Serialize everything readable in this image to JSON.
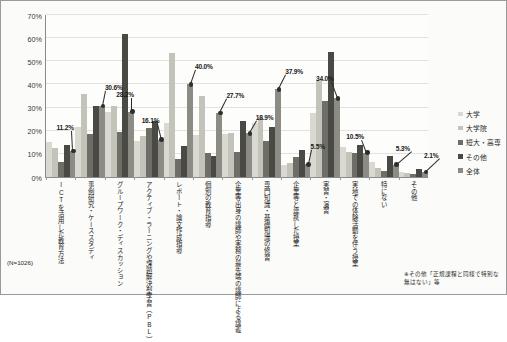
{
  "chart_data": {
    "type": "bar",
    "title": "",
    "xlabel": "",
    "ylabel": "",
    "ylim": [
      0,
      70
    ],
    "ytick_labels": [
      "0%",
      "10%",
      "20%",
      "30%",
      "40%",
      "50%",
      "60%",
      "70%"
    ],
    "ytick_values": [
      0,
      10,
      20,
      30,
      40,
      50,
      60,
      70
    ],
    "grid": true,
    "legend_position": "right",
    "categories": [
      "ICTを活用した教育方法",
      "事例研究・ケーススタディ",
      "グループワーク・ディスカッション",
      "アクティブ・ラーニングや課題解決型学習（PBL）",
      "レポート・論文作成指導",
      "個別の教育指導",
      "企業等出身の講師や実務の最先端の講師による講義",
      "専門知識・基礎知識の修習",
      "企業等と連携した授業",
      "実習・演習",
      "実地での体験活動を伴う授業",
      "特にない",
      "その他"
    ],
    "series": [
      {
        "name": "大学",
        "color": "#d9d9d2",
        "values": [
          15.0,
          21.5,
          28.0,
          15.4,
          23.2,
          18.0,
          18.8,
          23.5,
          5.0,
          27.5,
          13.0,
          6.5,
          2.0
        ]
      },
      {
        "name": "大学院",
        "color": "#c3c3ba",
        "values": [
          12.5,
          36.0,
          30.5,
          17.6,
          53.5,
          35.0,
          19.0,
          25.8,
          6.0,
          42.0,
          10.9,
          4.0,
          1.8
        ]
      },
      {
        "name": "短大・高専",
        "color": "#6e6e66",
        "values": [
          6.5,
          18.8,
          19.5,
          21.0,
          7.8,
          10.5,
          11.0,
          15.5,
          8.5,
          33.0,
          10.5,
          2.5,
          1.5
        ]
      },
      {
        "name": "その他",
        "color": "#4a4a44",
        "values": [
          14.0,
          30.8,
          62.0,
          24.0,
          13.5,
          9.0,
          24.2,
          21.5,
          11.8,
          54.0,
          14.0,
          9.0,
          3.5
        ]
      },
      {
        "name": "全体",
        "color": "#8c8c84",
        "values": [
          11.2,
          30.6,
          28.2,
          16.1,
          40.0,
          27.7,
          18.9,
          37.9,
          5.5,
          34.0,
          10.5,
          5.3,
          2.1
        ]
      }
    ],
    "data_labels": [
      {
        "category_index": 0,
        "value": 11.2,
        "text": "11.2%"
      },
      {
        "category_index": 1,
        "value": 30.6,
        "text": "30.6%"
      },
      {
        "category_index": 2,
        "value": 28.2,
        "text": "28.2%"
      },
      {
        "category_index": 3,
        "value": 16.1,
        "text": "16.1%"
      },
      {
        "category_index": 4,
        "value": 40.0,
        "text": "40.0%"
      },
      {
        "category_index": 5,
        "value": 27.7,
        "text": "27.7%"
      },
      {
        "category_index": 6,
        "value": 18.9,
        "text": "18.9%"
      },
      {
        "category_index": 7,
        "value": 37.9,
        "text": "37.9%"
      },
      {
        "category_index": 8,
        "value": 5.5,
        "text": "5.5%"
      },
      {
        "category_index": 9,
        "value": 34.0,
        "text": "34.0%"
      },
      {
        "category_index": 10,
        "value": 10.5,
        "text": "10.5%"
      },
      {
        "category_index": 11,
        "value": 5.3,
        "text": "5.3%"
      },
      {
        "category_index": 12,
        "value": 2.1,
        "text": "2.1%"
      }
    ]
  },
  "annotations": {
    "sample_size": "(N=1026)",
    "footnote": "※その他「正規課程と同様で特別な無はない」等"
  }
}
